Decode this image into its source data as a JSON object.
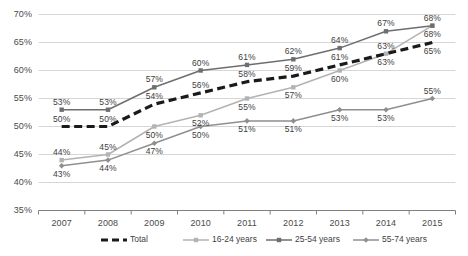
{
  "chart_data": {
    "type": "line",
    "title": "",
    "subtitle": "",
    "xlabel": "",
    "ylabel": "",
    "categories": [
      "2007",
      "2008",
      "2009",
      "2010",
      "2011",
      "2012",
      "2013",
      "2014",
      "2015"
    ],
    "ylim": [
      35,
      70
    ],
    "ytick_labels": [
      "35%",
      "40%",
      "45%",
      "50%",
      "55%",
      "60%",
      "65%",
      "70%"
    ],
    "ytick_values": [
      35,
      40,
      45,
      50,
      55,
      60,
      65,
      70
    ],
    "grid": true,
    "legend_position": "bottom",
    "series": [
      {
        "name": "Total",
        "color": "#1a1a1a",
        "style": "dashed",
        "marker": "none",
        "values": [
          50,
          50,
          54,
          56,
          58,
          59,
          61,
          63,
          65
        ],
        "labels": [
          "50%",
          "50%",
          "54%",
          "56%",
          "58%",
          "59%",
          "61%",
          "63%",
          "65%"
        ]
      },
      {
        "name": "16-24 years",
        "color": "#b3b3b3",
        "style": "solid",
        "marker": "square",
        "values": [
          44,
          45,
          50,
          52,
          55,
          57,
          60,
          63,
          68
        ],
        "labels": [
          "44%",
          "45%",
          "50%",
          "52%",
          "55%",
          "57%",
          "60%",
          "63%",
          "68%"
        ]
      },
      {
        "name": "25-54 years",
        "color": "#6e6e6e",
        "style": "solid",
        "marker": "square",
        "values": [
          53,
          53,
          57,
          60,
          61,
          62,
          64,
          67,
          68
        ],
        "labels": [
          "53%",
          "53%",
          "57%",
          "60%",
          "61%",
          "62%",
          "64%",
          "67%",
          "68%"
        ]
      },
      {
        "name": "55-74 years",
        "color": "#8f8f8f",
        "style": "solid",
        "marker": "diamond",
        "values": [
          43,
          44,
          47,
          50,
          51,
          51,
          53,
          53,
          55
        ],
        "labels": [
          "43%",
          "44%",
          "47%",
          "50%",
          "51%",
          "51%",
          "53%",
          "53%",
          "55%"
        ]
      }
    ]
  },
  "legend": {
    "items": [
      {
        "label": "Total"
      },
      {
        "label": "16-24 years"
      },
      {
        "label": "25-54 years"
      },
      {
        "label": "55-74 years"
      }
    ]
  },
  "colors": {
    "axis": "#808080",
    "grid": "#d6d6d6",
    "text": "#3f3f3f",
    "total": "#1a1a1a",
    "young": "#b3b3b3",
    "prime": "#6e6e6e",
    "older": "#8f8f8f"
  }
}
